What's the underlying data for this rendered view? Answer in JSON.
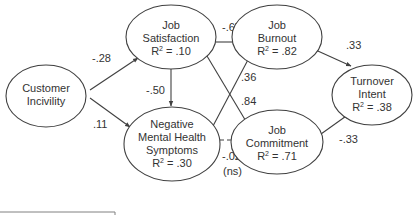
{
  "diagram": {
    "type": "path-model",
    "colors": {
      "stroke": "#404040",
      "text": "#333333",
      "background": "#ffffff"
    },
    "nodes": [
      {
        "id": "customer_incivility",
        "lines": [
          "Customer",
          "Incivility"
        ],
        "r2": null
      },
      {
        "id": "job_satisfaction",
        "lines": [
          "Job",
          "Satisfaction"
        ],
        "r2": ".10"
      },
      {
        "id": "negative_mental_health",
        "lines": [
          "Negative",
          "Mental Health",
          "Symptoms"
        ],
        "r2": ".30"
      },
      {
        "id": "job_burnout",
        "lines": [
          "Job",
          "Burnout"
        ],
        "r2": ".82"
      },
      {
        "id": "job_commitment",
        "lines": [
          "Job",
          "Commitment"
        ],
        "r2": ".71"
      },
      {
        "id": "turnover_intent",
        "lines": [
          "Turnover",
          "Intent"
        ],
        "r2": ".38"
      }
    ],
    "r2_prefix": "R",
    "r2_sup": "2",
    "r2_eq": " = ",
    "edges": [
      {
        "from": "customer_incivility",
        "to": "job_satisfaction",
        "label": "-.28",
        "style": "solid"
      },
      {
        "from": "customer_incivility",
        "to": "negative_mental_health",
        "label": ".11",
        "style": "solid"
      },
      {
        "from": "job_satisfaction",
        "to": "negative_mental_health",
        "label": "-.50",
        "style": "solid"
      },
      {
        "from": "job_satisfaction",
        "to": "job_burnout",
        "label": "-.67",
        "style": "solid"
      },
      {
        "from": "job_satisfaction",
        "to": "job_commitment",
        "label": ".84",
        "style": "solid"
      },
      {
        "from": "negative_mental_health",
        "to": "job_burnout",
        "label": ".36",
        "style": "solid"
      },
      {
        "from": "negative_mental_health",
        "to": "job_commitment",
        "label": "-.02",
        "sublabel": "(ns)",
        "style": "dashed"
      },
      {
        "from": "job_burnout",
        "to": "turnover_intent",
        "label": ".33",
        "style": "solid"
      },
      {
        "from": "job_commitment",
        "to": "turnover_intent",
        "label": "-.33",
        "style": "solid"
      }
    ]
  }
}
